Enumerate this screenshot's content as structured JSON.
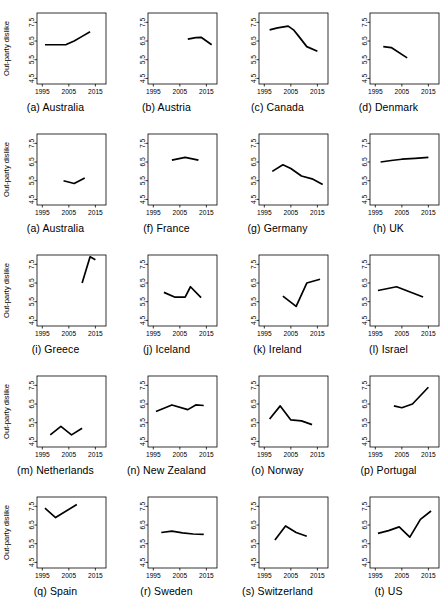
{
  "figure": {
    "ylabel": "Out-party dislike",
    "y_ticks": [
      "4.5",
      "5.5",
      "6.5",
      "7.5"
    ],
    "x_ticks": [
      "1995",
      "2005",
      "2015"
    ],
    "ylim": [
      4.2,
      8.0
    ],
    "xlim": [
      1993,
      2019
    ],
    "line_color": "#000000",
    "background": "#ffffff",
    "grid": false,
    "rows": 5,
    "cols": 4
  },
  "chart_data": {
    "type": "line",
    "title": "",
    "xlabel": "",
    "ylabel": "Out-party dislike",
    "ylim": [
      4.2,
      8.0
    ],
    "xlim": [
      1993,
      2019
    ],
    "y_ticks": [
      4.5,
      5.5,
      6.5,
      7.5
    ],
    "x_ticks": [
      1995,
      2005,
      2015
    ],
    "grid": false,
    "legend": "none",
    "panels": [
      {
        "index": 0,
        "caption": "(a) Australia",
        "label": "(a)",
        "country": "Australia",
        "show_ylabel": true,
        "x": [
          1996,
          2001,
          2004,
          2007,
          2010,
          2013
        ],
        "values": [
          6.3,
          6.3,
          6.31,
          6.5,
          6.75,
          7.0
        ]
      },
      {
        "index": 1,
        "caption": "(b) Austria",
        "label": "(b)",
        "country": "Austria",
        "show_ylabel": false,
        "x": [
          2008,
          2011,
          2013,
          2017
        ],
        "values": [
          6.6,
          6.68,
          6.7,
          6.3
        ]
      },
      {
        "index": 2,
        "caption": "(c) Canada",
        "label": "(c)",
        "country": "Canada",
        "show_ylabel": false,
        "x": [
          1997,
          2000,
          2004,
          2006,
          2008,
          2011,
          2015
        ],
        "values": [
          7.1,
          7.2,
          7.3,
          7.1,
          6.75,
          6.2,
          5.95
        ]
      },
      {
        "index": 3,
        "caption": "(d) Denmark",
        "label": "(d)",
        "country": "Denmark",
        "show_ylabel": false,
        "x": [
          1998,
          2001,
          2007
        ],
        "values": [
          6.2,
          6.15,
          5.6
        ]
      },
      {
        "index": 4,
        "caption": "(a) Australia",
        "label": "(a)",
        "country": "Australia",
        "show_ylabel": true,
        "x": [
          2003,
          2007,
          2011
        ],
        "values": [
          5.5,
          5.35,
          5.65
        ]
      },
      {
        "index": 5,
        "caption": "(f) France",
        "label": "(f)",
        "country": "France",
        "show_ylabel": false,
        "x": [
          2002,
          2007,
          2012
        ],
        "values": [
          6.6,
          6.75,
          6.6
        ]
      },
      {
        "index": 6,
        "caption": "(g) Germany",
        "label": "(g)",
        "country": "Germany",
        "show_ylabel": false,
        "x": [
          1998,
          2002,
          2005,
          2009,
          2013,
          2017
        ],
        "values": [
          6.0,
          6.35,
          6.15,
          5.75,
          5.6,
          5.3
        ]
      },
      {
        "index": 7,
        "caption": "(h) UK",
        "label": "(h)",
        "country": "UK",
        "show_ylabel": false,
        "x": [
          1997,
          2001,
          2005,
          2010,
          2015
        ],
        "values": [
          6.5,
          6.58,
          6.65,
          6.7,
          6.75
        ]
      },
      {
        "index": 8,
        "caption": "(i) Greece",
        "label": "(i)",
        "country": "Greece",
        "show_ylabel": true,
        "x": [
          2010,
          2013,
          2015
        ],
        "values": [
          6.5,
          7.9,
          7.75
        ]
      },
      {
        "index": 9,
        "caption": "(j) Iceland",
        "label": "(j)",
        "country": "Iceland",
        "show_ylabel": false,
        "x": [
          1999,
          2003,
          2007,
          2009,
          2013
        ],
        "values": [
          6.0,
          5.75,
          5.75,
          6.3,
          5.72
        ]
      },
      {
        "index": 10,
        "caption": "(k) Ireland",
        "label": "(k)",
        "country": "Ireland",
        "show_ylabel": false,
        "x": [
          2002,
          2007,
          2011,
          2016
        ],
        "values": [
          5.8,
          5.25,
          6.5,
          6.7
        ]
      },
      {
        "index": 11,
        "caption": "(l) Israel",
        "label": "(l)",
        "country": "Israel",
        "show_ylabel": false,
        "x": [
          1996,
          2003,
          2013
        ],
        "values": [
          6.1,
          6.3,
          5.75
        ]
      },
      {
        "index": 12,
        "caption": "(m) Netherlands",
        "label": "(m)",
        "country": "Netherlands",
        "show_ylabel": true,
        "x": [
          1998,
          2002,
          2006,
          2010
        ],
        "values": [
          4.85,
          5.3,
          4.85,
          5.2
        ]
      },
      {
        "index": 13,
        "caption": "(n) New Zealand",
        "label": "(n)",
        "country": "New Zealand",
        "show_ylabel": false,
        "x": [
          1996,
          2002,
          2008,
          2011,
          2014
        ],
        "values": [
          6.1,
          6.45,
          6.2,
          6.45,
          6.42
        ]
      },
      {
        "index": 14,
        "caption": "(o) Norway",
        "label": "(o)",
        "country": "Norway",
        "show_ylabel": false,
        "x": [
          1997,
          2001,
          2005,
          2009,
          2013
        ],
        "values": [
          5.7,
          6.4,
          5.65,
          5.6,
          5.4
        ]
      },
      {
        "index": 15,
        "caption": "(p) Portugal",
        "label": "(p)",
        "country": "Portugal",
        "show_ylabel": false,
        "x": [
          2002,
          2005,
          2009,
          2015
        ],
        "values": [
          6.4,
          6.3,
          6.5,
          7.4
        ]
      },
      {
        "index": 16,
        "caption": "(q) Spain",
        "label": "(q)",
        "country": "Spain",
        "show_ylabel": true,
        "x": [
          1996,
          2000,
          2008
        ],
        "values": [
          7.4,
          6.9,
          7.6
        ]
      },
      {
        "index": 17,
        "caption": "(r) Sweden",
        "label": "(r)",
        "country": "Sweden",
        "show_ylabel": false,
        "x": [
          1998,
          2002,
          2006,
          2010,
          2014
        ],
        "values": [
          6.1,
          6.17,
          6.08,
          6.02,
          6.0
        ]
      },
      {
        "index": 18,
        "caption": "(s) Switzerland",
        "label": "(s)",
        "country": "Switzerland",
        "show_ylabel": false,
        "x": [
          1999,
          2003,
          2007,
          2011
        ],
        "values": [
          5.7,
          6.45,
          6.1,
          5.9
        ]
      },
      {
        "index": 19,
        "caption": "(t) US",
        "label": "(t)",
        "country": "US",
        "show_ylabel": false,
        "x": [
          1996,
          2000,
          2004,
          2008,
          2012,
          2016
        ],
        "values": [
          6.05,
          6.2,
          6.4,
          5.85,
          6.8,
          7.25
        ]
      }
    ]
  }
}
